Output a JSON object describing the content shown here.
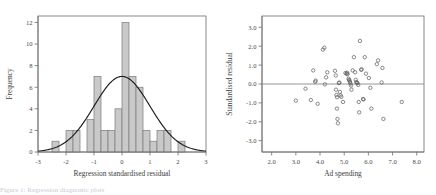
{
  "figure": {
    "caption": "Figure 1: Regression diagnostic plots"
  },
  "chart_data": [
    {
      "type": "bar",
      "name": "histogram-of-standardised-residuals",
      "title": "",
      "xlabel": "Regression standardised residual",
      "ylabel": "Frequency",
      "xlim": [
        -3,
        3
      ],
      "ylim": [
        0,
        12.6
      ],
      "grid": false,
      "legend": "none",
      "bin_width": 0.25,
      "xticks": [
        -3,
        -2,
        -1,
        0,
        1,
        2,
        3
      ],
      "xticklabels": [
        "-3",
        "-2",
        "-1",
        "0",
        "1",
        "2",
        "3"
      ],
      "yticks": [
        0,
        2,
        4,
        6,
        8,
        10,
        12
      ],
      "yticklabels": [
        "0",
        "2",
        "4",
        "6",
        "8",
        "10",
        "12"
      ],
      "bin_left_edges": [
        -2.5,
        -2.0,
        -1.75,
        -1.25,
        -1.0,
        -0.75,
        -0.5,
        -0.25,
        0.0,
        0.25,
        0.5,
        0.75,
        1.0,
        1.25,
        1.5,
        2.0
      ],
      "categories": [
        "-2.50",
        "-2.00",
        "-1.75",
        "-1.25",
        "-1.00",
        "-0.75",
        "-0.50",
        "-0.25",
        "0.00",
        "0.25",
        "0.50",
        "0.75",
        "1.00",
        "1.25",
        "1.50",
        "2.00"
      ],
      "values": [
        1,
        2,
        2,
        3,
        7,
        2,
        2,
        4,
        12,
        7,
        6,
        2,
        1,
        2,
        2,
        1
      ],
      "overlay": {
        "type": "normal-curve",
        "mean": 0.0,
        "sd": 1.0,
        "peak_value": 7.0
      }
    },
    {
      "type": "scatter",
      "name": "residuals-vs-ad-spending",
      "title": "",
      "xlabel": "Ad spending",
      "ylabel": "Standardised residual",
      "xlim": [
        1.6,
        8.3
      ],
      "ylim": [
        -3.6,
        3.6
      ],
      "grid": false,
      "legend": "none",
      "marker": "open-circle",
      "xticks": [
        2.0,
        3.0,
        4.0,
        5.0,
        6.0,
        7.0,
        8.0
      ],
      "xticklabels": [
        "2.0",
        "3.0",
        "4.0",
        "5.0",
        "6.0",
        "7.0",
        "8.0"
      ],
      "yticks": [
        3.0,
        2.0,
        1.0,
        0.0,
        -1.0,
        -2.0,
        -3.0
      ],
      "yticklabels": [
        "3.0",
        "2.0",
        "1.0",
        "0.0",
        "-1.0",
        "-2.0",
        "-3.0"
      ],
      "reference_line_y": 0.0,
      "points": [
        [
          3.0,
          -0.88
        ],
        [
          3.4,
          -0.25
        ],
        [
          3.62,
          -0.85
        ],
        [
          3.72,
          0.72
        ],
        [
          3.8,
          0.12
        ],
        [
          3.82,
          0.18
        ],
        [
          3.9,
          -1.05
        ],
        [
          4.12,
          1.82
        ],
        [
          4.18,
          1.92
        ],
        [
          4.2,
          -0.02
        ],
        [
          4.25,
          0.35
        ],
        [
          4.3,
          0.62
        ],
        [
          4.62,
          0.7
        ],
        [
          4.65,
          0.45
        ],
        [
          4.66,
          -0.3
        ],
        [
          4.68,
          -0.58
        ],
        [
          4.7,
          -0.7
        ],
        [
          4.7,
          -1.3
        ],
        [
          4.72,
          -1.85
        ],
        [
          4.74,
          -2.08
        ],
        [
          4.78,
          0.05
        ],
        [
          4.8,
          0.08
        ],
        [
          4.82,
          -0.42
        ],
        [
          4.85,
          -0.6
        ],
        [
          4.88,
          -0.68
        ],
        [
          4.95,
          -0.95
        ],
        [
          5.05,
          0.58
        ],
        [
          5.1,
          0.55
        ],
        [
          5.12,
          0.6
        ],
        [
          5.14,
          0.52
        ],
        [
          5.18,
          0.28
        ],
        [
          5.2,
          0.22
        ],
        [
          5.22,
          0.18
        ],
        [
          5.24,
          0.1
        ],
        [
          5.26,
          0.02
        ],
        [
          5.28,
          -0.08
        ],
        [
          5.3,
          -0.3
        ],
        [
          5.35,
          0.72
        ],
        [
          5.4,
          1.42
        ],
        [
          5.45,
          0.62
        ],
        [
          5.48,
          0.22
        ],
        [
          5.5,
          0.1
        ],
        [
          5.52,
          0.06
        ],
        [
          5.55,
          0.05
        ],
        [
          5.58,
          -0.05
        ],
        [
          5.6,
          -0.95
        ],
        [
          5.62,
          -1.5
        ],
        [
          5.65,
          2.28
        ],
        [
          5.7,
          0.75
        ],
        [
          5.72,
          0.78
        ],
        [
          5.78,
          -0.8
        ],
        [
          5.8,
          -0.82
        ],
        [
          5.85,
          1.42
        ],
        [
          5.9,
          0.55
        ],
        [
          6.02,
          0.32
        ],
        [
          6.08,
          -0.2
        ],
        [
          6.12,
          -1.3
        ],
        [
          6.35,
          1.05
        ],
        [
          6.4,
          1.25
        ],
        [
          6.55,
          0.08
        ],
        [
          6.58,
          0.85
        ],
        [
          6.62,
          -1.85
        ],
        [
          7.38,
          -0.95
        ]
      ]
    }
  ]
}
